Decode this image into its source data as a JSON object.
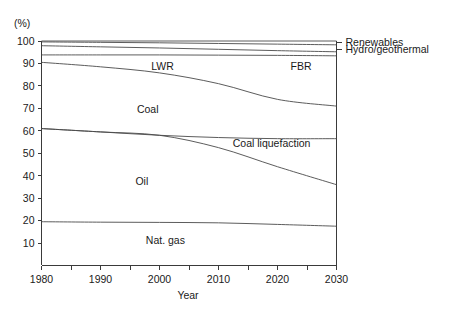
{
  "chart_data": {
    "type": "area",
    "title": "",
    "subtitle": "",
    "xlabel": "Year",
    "ylabel": "(%)",
    "unit_label": "(%)",
    "xlim": [
      1980,
      2030
    ],
    "ylim": [
      0,
      100
    ],
    "grid": false,
    "legend_position": "right-outside",
    "x_tick_labels": [
      "1980",
      "1990",
      "2000",
      "2010",
      "2020",
      "2030"
    ],
    "x_tick_values": [
      1980,
      1990,
      2000,
      2010,
      2020,
      2030
    ],
    "x_minor_tick_values": [
      1985,
      1995,
      2005,
      2015,
      2025
    ],
    "y_tick_labels": [
      "10",
      "20",
      "30",
      "40",
      "50",
      "60",
      "70",
      "80",
      "90",
      "100"
    ],
    "y_tick_values": [
      10,
      20,
      30,
      40,
      50,
      60,
      70,
      80,
      90,
      100
    ],
    "x": [
      1980,
      1990,
      2000,
      2010,
      2020,
      2030
    ],
    "note": "Stacked cumulative share of primary energy supply; plotted curves are cumulative boundary lines.",
    "boundaries": [
      {
        "name": "Renewables upper boundary",
        "values": [
          100.0,
          100.0,
          100.0,
          100.0,
          100.0,
          100.0
        ]
      },
      {
        "name": "Renewables lower boundary",
        "values": [
          99.6,
          99.4,
          99.2,
          98.9,
          98.6,
          98.3
        ]
      },
      {
        "name": "Hydro/geothermal lower boundary",
        "values": [
          97.9,
          97.4,
          96.9,
          96.3,
          95.7,
          95.2
        ]
      },
      {
        "name": "FBR / LWR upper boundary",
        "values": [
          93.8,
          93.8,
          93.8,
          93.7,
          93.6,
          93.4
        ]
      },
      {
        "name": "LWR lower boundary (Coal upper)",
        "values": [
          90.5,
          88.5,
          85.8,
          81.0,
          74.0,
          71.0
        ]
      },
      {
        "name": "Coal lower boundary (Coal liquefaction upper)",
        "values": [
          61.0,
          59.5,
          58.0,
          57.0,
          56.5,
          56.5
        ]
      },
      {
        "name": "Coal liquefaction lower boundary (Oil upper)",
        "values": [
          61.0,
          59.5,
          58.0,
          52.5,
          44.0,
          36.0
        ]
      },
      {
        "name": "Nat. gas upper boundary",
        "values": [
          19.5,
          19.3,
          19.2,
          19.0,
          18.3,
          17.5
        ]
      }
    ],
    "series": [
      {
        "name": "Renewables",
        "values": [
          0.4,
          0.6,
          0.8,
          1.1,
          1.4,
          1.7
        ]
      },
      {
        "name": "Hydro/geothermal",
        "values": [
          1.7,
          2.0,
          2.3,
          2.6,
          2.9,
          3.1
        ]
      },
      {
        "name": "FBR",
        "values": [
          4.1,
          3.6,
          3.1,
          2.6,
          2.1,
          1.8
        ]
      },
      {
        "name": "LWR",
        "values": [
          3.3,
          5.3,
          8.0,
          12.7,
          19.6,
          22.4
        ]
      },
      {
        "name": "Coal",
        "values": [
          29.5,
          29.0,
          27.8,
          24.0,
          17.5,
          14.5
        ]
      },
      {
        "name": "Coal liquefaction",
        "values": [
          0.0,
          0.0,
          0.0,
          4.5,
          12.5,
          20.5
        ]
      },
      {
        "name": "Oil",
        "values": [
          41.5,
          40.2,
          38.8,
          33.5,
          25.7,
          18.5
        ]
      },
      {
        "name": "Nat. gas",
        "values": [
          19.5,
          19.3,
          19.2,
          19.0,
          18.3,
          17.5
        ]
      }
    ],
    "inner_labels": [
      {
        "text": "LWR",
        "x": 2000.5,
        "y": 87.0
      },
      {
        "text": "FBR",
        "x": 2024.0,
        "y": 87.0
      },
      {
        "text": "Coal",
        "x": 1998.0,
        "y": 68.0
      },
      {
        "text": "Coal liquefaction",
        "x": 2019.0,
        "y": 53.0
      },
      {
        "text": "Oil",
        "x": 1997.0,
        "y": 36.0
      },
      {
        "text": "Nat. gas",
        "x": 2001.0,
        "y": 9.5
      }
    ],
    "right_legend": [
      {
        "text": "Renewables",
        "y": 99.4
      },
      {
        "text": "Hydro/geothermal",
        "y": 96.3
      }
    ],
    "colors": {
      "background": "#ffffff",
      "line": "#4a4a4a",
      "axis": "#3a3a3a",
      "text": "#1a1a1a"
    }
  }
}
